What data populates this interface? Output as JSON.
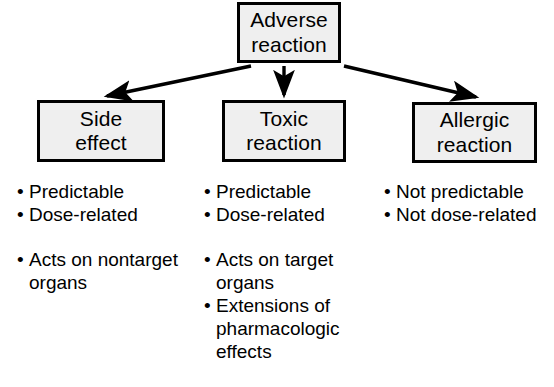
{
  "diagram": {
    "bullet_glyph": "•",
    "colors": {
      "background": "#ffffff",
      "box_fill": "#efefef",
      "box_border": "#000000",
      "text": "#000000",
      "arrow": "#000000"
    },
    "root": {
      "label": "Adverse reaction",
      "line1": "Adverse",
      "line2": "reaction"
    },
    "branches": [
      {
        "id": "side-effect",
        "label": "Side effect",
        "line1": "Side",
        "line2": "effect",
        "arrow": "diagonal-left-arrow",
        "bullets": [
          {
            "text": "Predictable",
            "gap_before": false
          },
          {
            "text": "Dose-related",
            "gap_before": false
          },
          {
            "text": "Acts on nontarget organs",
            "gap_before": true
          }
        ]
      },
      {
        "id": "toxic-reaction",
        "label": "Toxic reaction",
        "line1": "Toxic",
        "line2": "reaction",
        "arrow": "vertical-down-arrow",
        "bullets": [
          {
            "text": "Predictable",
            "gap_before": false
          },
          {
            "text": "Dose-related",
            "gap_before": false
          },
          {
            "text": "Acts on target organs",
            "gap_before": true
          },
          {
            "text": "Extensions of pharmacologic effects",
            "gap_before": false
          }
        ]
      },
      {
        "id": "allergic-reaction",
        "label": "Allergic reaction",
        "line1": "Allergic",
        "line2": "reaction",
        "arrow": "diagonal-right-arrow",
        "bullets": [
          {
            "text": "Not predictable",
            "gap_before": false
          },
          {
            "text": "Not dose-related",
            "gap_before": false
          }
        ]
      }
    ]
  }
}
